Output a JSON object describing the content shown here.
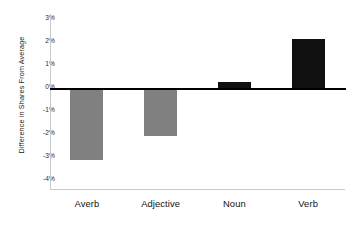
{
  "chart_data": {
    "type": "bar",
    "title": "",
    "xlabel": "",
    "ylabel": "Difference in Shares From Average",
    "categories": [
      "Averb",
      "Adjective",
      "Noun",
      "Verb"
    ],
    "values": [
      -2.8,
      -1.85,
      0.3,
      2.0
    ],
    "value_labels": [
      "-2.8%",
      "-1.85%",
      "0.3%",
      "2.0%"
    ],
    "series": [
      {
        "name": "Difference in Shares From Average",
        "values": [
          -2.8,
          -1.85,
          0.3,
          2.0
        ]
      }
    ],
    "bar_colors": [
      "#808080",
      "#808080",
      "#101010",
      "#101010"
    ],
    "ylim": [
      -4,
      3
    ],
    "ytick_values": [
      3,
      2,
      1,
      0,
      -1,
      -2,
      -3,
      -4
    ],
    "ytick_labels": [
      "3%",
      "2%",
      "1%",
      "0%",
      "-1%",
      "-2%",
      "-3%",
      "-4%"
    ],
    "grid": false,
    "legend": null,
    "legend_position": "none",
    "zero_line": true,
    "axis_color": "#c9c9c9",
    "zero_line_color": "#000000",
    "negative_bar_color": "#808080",
    "positive_bar_color": "#101010",
    "background_color": "#ffffff"
  }
}
